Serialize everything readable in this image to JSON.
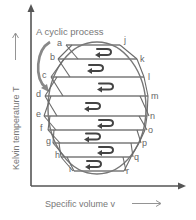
{
  "diagram": {
    "title": "A cyclic process",
    "x_axis_label": "Specific volume v",
    "y_axis_label": "Kelvin temperature T",
    "left_points": [
      "a",
      "b",
      "c",
      "d",
      "e",
      "f",
      "g",
      "h",
      "i"
    ],
    "right_points": [
      "j",
      "k",
      "l",
      "m",
      "n",
      "o",
      "p",
      "q",
      "r"
    ],
    "cycles": 8,
    "cycle_direction": "anticlockwise",
    "line_color": "#777777",
    "arrow_color": "#444444"
  }
}
